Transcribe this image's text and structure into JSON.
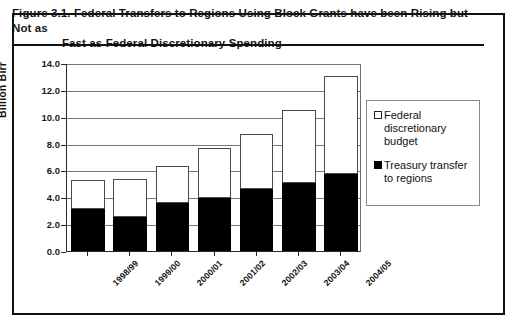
{
  "figure": {
    "number": "Figure 3.1.",
    "title_line1": "Federal Transfers to Regions Using Block Grants have been Rising but Not as",
    "title_line2": "Fast as Federal Discretionary Spending"
  },
  "legend": {
    "items": [
      {
        "label": "Federal discretionary budget",
        "swatch": "open-square",
        "color": "#ffffff"
      },
      {
        "label": "Treasury transfer to regions",
        "swatch": "filled-square",
        "color": "#000000"
      }
    ]
  },
  "chart_data": {
    "type": "bar",
    "subtype": "stacked",
    "title": "Federal Transfers to Regions Using Block Grants have been Rising but Not as Fast as Federal Discretionary Spending",
    "xlabel": "",
    "ylabel": "Billion Birr",
    "ylim": [
      0.0,
      14.0
    ],
    "ytick_labels": [
      "14.0",
      "12.0",
      "10.0",
      "8.0",
      "6.0",
      "4.0",
      "2.0",
      "0.0"
    ],
    "ytick_values": [
      14.0,
      12.0,
      10.0,
      8.0,
      6.0,
      4.0,
      2.0,
      0.0
    ],
    "grid": true,
    "legend_position": "right",
    "categories": [
      "1998/99",
      "1999/00",
      "2000/01",
      "2001/02",
      "2002/03",
      "2003/04",
      "2004/05"
    ],
    "series": [
      {
        "name": "Treasury transfer to regions",
        "color": "#000000",
        "values": [
          3.15,
          2.55,
          3.6,
          3.95,
          4.6,
          5.1,
          5.7
        ]
      },
      {
        "name": "Federal discretionary budget",
        "color": "#ffffff",
        "values": [
          2.15,
          2.8,
          2.7,
          3.75,
          4.1,
          5.4,
          7.3
        ]
      }
    ],
    "totals": [
      5.3,
      5.35,
      6.3,
      7.7,
      8.7,
      10.5,
      13.0
    ]
  },
  "scrap_text": ""
}
